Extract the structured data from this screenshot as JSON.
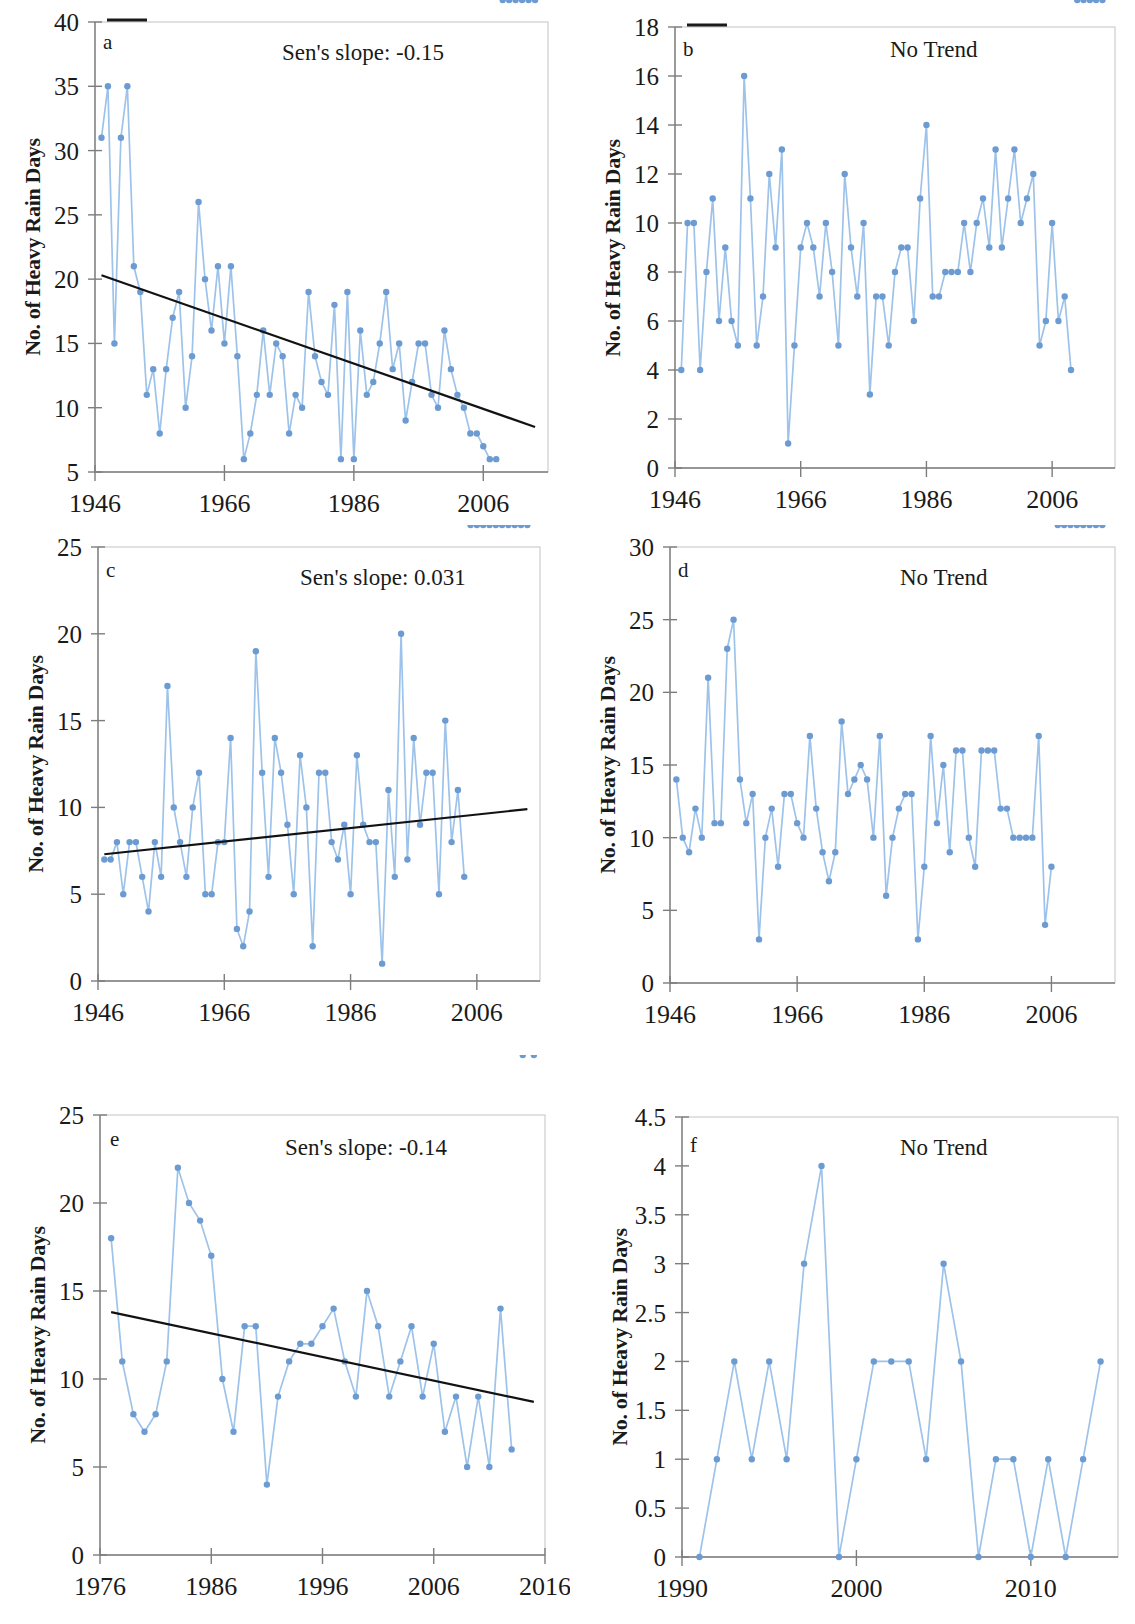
{
  "figure": {
    "axis_label_y": "No. of Heavy Rain Days",
    "marker_color": "#6c9bd2",
    "line_color": "#9dc3ea",
    "trend_color": "#121212"
  },
  "chart_data": [
    {
      "type": "line",
      "panel": "a",
      "title": "",
      "annotation": "Sen's slope: -0.15",
      "xlabel": "",
      "ylabel": "No. of Heavy Rain Days",
      "xlim": [
        1946,
        2016
      ],
      "ylim": [
        5,
        40
      ],
      "yticks": [
        5,
        10,
        15,
        20,
        25,
        30,
        35,
        40
      ],
      "xticks": [
        1946,
        1966,
        1986,
        2006
      ],
      "grid": false,
      "trendline": {
        "x": [
          1947,
          2014
        ],
        "y": [
          20.3,
          8.5
        ]
      },
      "x": [
        1947,
        1948,
        1949,
        1950,
        1951,
        1952,
        1953,
        1954,
        1955,
        1956,
        1957,
        1958,
        1959,
        1960,
        1961,
        1962,
        1963,
        1964,
        1965,
        1966,
        1967,
        1968,
        1969,
        1970,
        1971,
        1972,
        1973,
        1974,
        1975,
        1976,
        1977,
        1978,
        1979,
        1980,
        1981,
        1982,
        1983,
        1984,
        1985,
        1986,
        1987,
        1988,
        1989,
        1990,
        1991,
        1992,
        1993,
        1994,
        1995,
        1996,
        1997,
        1998,
        1999,
        2000,
        2001,
        2002,
        2003,
        2004,
        2005,
        2006,
        2007,
        2008,
        2009,
        2010,
        2011,
        2012,
        2013,
        2014
      ],
      "values": [
        31,
        35,
        15,
        31,
        35,
        21,
        19,
        11,
        13,
        8,
        13,
        17,
        19,
        10,
        14,
        26,
        20,
        16,
        21,
        15,
        21,
        14,
        6,
        8,
        11,
        16,
        11,
        15,
        14,
        8,
        11,
        10,
        19,
        14,
        12,
        11,
        18,
        6,
        19,
        6,
        16,
        11,
        12,
        15,
        19,
        13,
        15,
        9,
        12,
        15,
        15,
        11,
        10,
        16,
        13,
        11,
        10,
        8,
        8,
        7,
        6,
        6
      ]
    },
    {
      "type": "line",
      "panel": "b",
      "title": "",
      "annotation": "No Trend",
      "xlabel": "",
      "ylabel": "No. of Heavy Rain Days",
      "xlim": [
        1946,
        2016
      ],
      "ylim": [
        0,
        18
      ],
      "yticks": [
        0,
        2,
        4,
        6,
        8,
        10,
        12,
        14,
        16,
        18
      ],
      "xticks": [
        1946,
        1966,
        1986,
        2006
      ],
      "grid": false,
      "trendline": null,
      "x": [
        1947,
        1948,
        1949,
        1950,
        1951,
        1952,
        1953,
        1954,
        1955,
        1956,
        1957,
        1958,
        1959,
        1960,
        1961,
        1962,
        1963,
        1964,
        1965,
        1966,
        1967,
        1968,
        1969,
        1970,
        1971,
        1972,
        1973,
        1974,
        1975,
        1976,
        1977,
        1978,
        1979,
        1980,
        1981,
        1982,
        1983,
        1984,
        1985,
        1986,
        1987,
        1988,
        1989,
        1990,
        1991,
        1992,
        1993,
        1994,
        1995,
        1996,
        1997,
        1998,
        1999,
        2000,
        2001,
        2002,
        2003,
        2004,
        2005,
        2006,
        2007,
        2008,
        2009,
        2010,
        2011,
        2012,
        2013,
        2014
      ],
      "values": [
        4,
        10,
        10,
        4,
        8,
        11,
        6,
        9,
        6,
        5,
        16,
        11,
        5,
        7,
        12,
        9,
        13,
        1,
        5,
        9,
        10,
        9,
        7,
        10,
        8,
        5,
        12,
        9,
        7,
        10,
        3,
        7,
        7,
        5,
        8,
        9,
        9,
        6,
        11,
        14,
        7,
        7,
        8,
        8,
        8,
        10,
        8,
        10,
        11,
        9,
        13,
        9,
        11,
        13,
        10,
        11,
        12,
        5,
        6,
        10,
        6,
        7,
        4
      ]
    },
    {
      "type": "line",
      "panel": "c",
      "title": "",
      "annotation": "Sen's slope: 0.031",
      "xlabel": "",
      "ylabel": "No. of Heavy Rain Days",
      "xlim": [
        1946,
        2016
      ],
      "ylim": [
        0,
        25
      ],
      "yticks": [
        0,
        5,
        10,
        15,
        20,
        25
      ],
      "xticks": [
        1946,
        1966,
        1986,
        2006
      ],
      "grid": false,
      "trendline": {
        "x": [
          1947,
          2014
        ],
        "y": [
          7.3,
          9.9
        ]
      },
      "x": [
        1947,
        1948,
        1949,
        1950,
        1951,
        1952,
        1953,
        1954,
        1955,
        1956,
        1957,
        1958,
        1959,
        1960,
        1961,
        1962,
        1963,
        1964,
        1965,
        1966,
        1967,
        1968,
        1969,
        1970,
        1971,
        1972,
        1973,
        1974,
        1975,
        1976,
        1977,
        1978,
        1979,
        1980,
        1981,
        1982,
        1983,
        1984,
        1985,
        1986,
        1987,
        1988,
        1989,
        1990,
        1991,
        1992,
        1993,
        1994,
        1995,
        1996,
        1997,
        1998,
        1999,
        2000,
        2001,
        2002,
        2003,
        2004,
        2005,
        2006,
        2007,
        2008,
        2009,
        2010,
        2011,
        2012,
        2013,
        2014
      ],
      "values": [
        7,
        7,
        8,
        5,
        8,
        8,
        6,
        4,
        8,
        6,
        17,
        10,
        8,
        6,
        10,
        12,
        5,
        5,
        8,
        8,
        14,
        3,
        2,
        4,
        19,
        12,
        6,
        14,
        12,
        9,
        5,
        13,
        10,
        2,
        12,
        12,
        8,
        7,
        9,
        5,
        13,
        9,
        8,
        8,
        1,
        11,
        6,
        20,
        7,
        14,
        9,
        12,
        12,
        5,
        15,
        8,
        11,
        6
      ]
    },
    {
      "type": "line",
      "panel": "d",
      "title": "",
      "annotation": "No Trend",
      "xlabel": "",
      "ylabel": "No. of Heavy Rain Days",
      "xlim": [
        1946,
        2016
      ],
      "ylim": [
        0,
        30
      ],
      "yticks": [
        0,
        5,
        10,
        15,
        20,
        25,
        30
      ],
      "xticks": [
        1946,
        1966,
        1986,
        2006
      ],
      "grid": false,
      "trendline": null,
      "x": [
        1947,
        1948,
        1949,
        1950,
        1951,
        1952,
        1953,
        1954,
        1955,
        1956,
        1957,
        1958,
        1959,
        1960,
        1961,
        1962,
        1963,
        1964,
        1965,
        1966,
        1967,
        1968,
        1969,
        1970,
        1971,
        1972,
        1973,
        1974,
        1975,
        1976,
        1977,
        1978,
        1979,
        1980,
        1981,
        1982,
        1983,
        1984,
        1985,
        1986,
        1987,
        1988,
        1989,
        1990,
        1991,
        1992,
        1993,
        1994,
        1995,
        1996,
        1997,
        1998,
        1999,
        2000,
        2001,
        2002,
        2003,
        2004,
        2005,
        2006,
        2007,
        2008,
        2009,
        2010,
        2011,
        2012,
        2013,
        2014
      ],
      "values": [
        14,
        10,
        9,
        12,
        10,
        21,
        11,
        11,
        23,
        25,
        14,
        11,
        13,
        3,
        10,
        12,
        8,
        13,
        13,
        11,
        10,
        17,
        12,
        9,
        7,
        9,
        18,
        13,
        14,
        15,
        14,
        10,
        17,
        6,
        10,
        12,
        13,
        13,
        3,
        8,
        17,
        11,
        15,
        9,
        16,
        16,
        10,
        8,
        16,
        16,
        16,
        12,
        12,
        10,
        10,
        10,
        10,
        17,
        4,
        8
      ]
    },
    {
      "type": "line",
      "panel": "e",
      "title": "",
      "annotation": "Sen's slope: -0.14",
      "xlabel": "",
      "ylabel": "No. of Heavy Rain Days",
      "xlim": [
        1976,
        2016
      ],
      "ylim": [
        0,
        25
      ],
      "yticks": [
        0,
        5,
        10,
        15,
        20,
        25
      ],
      "xticks": [
        1976,
        1986,
        1996,
        2006,
        2016
      ],
      "grid": false,
      "trendline": {
        "x": [
          1977,
          2015
        ],
        "y": [
          13.8,
          8.7
        ]
      },
      "x": [
        1977,
        1978,
        1979,
        1980,
        1981,
        1982,
        1983,
        1984,
        1985,
        1986,
        1987,
        1988,
        1989,
        1990,
        1991,
        1992,
        1993,
        1994,
        1995,
        1996,
        1997,
        1998,
        1999,
        2000,
        2001,
        2002,
        2003,
        2004,
        2005,
        2006,
        2007,
        2008,
        2009,
        2010,
        2011,
        2012,
        2013,
        2014,
        2015
      ],
      "values": [
        18,
        11,
        8,
        7,
        8,
        11,
        22,
        20,
        19,
        17,
        10,
        7,
        13,
        13,
        4,
        9,
        11,
        12,
        12,
        13,
        14,
        11,
        9,
        15,
        13,
        9,
        11,
        13,
        9,
        12,
        7,
        9,
        5,
        9,
        5,
        14,
        6
      ]
    },
    {
      "type": "line",
      "panel": "f",
      "title": "",
      "annotation": "No Trend",
      "xlabel": "",
      "ylabel": "No. of Heavy Rain Days",
      "xlim": [
        1990,
        2015
      ],
      "ylim": [
        0,
        4.5
      ],
      "yticks": [
        0,
        0.5,
        1,
        1.5,
        2,
        2.5,
        3,
        3.5,
        4,
        4.5
      ],
      "xticks": [
        1990,
        2000,
        2010
      ],
      "grid": false,
      "trendline": null,
      "x": [
        1991,
        1992,
        1993,
        1994,
        1995,
        1996,
        1997,
        1998,
        1999,
        2000,
        2001,
        2002,
        2003,
        2004,
        2005,
        2006,
        2007,
        2008,
        2009,
        2010,
        2011,
        2012,
        2013,
        2014
      ],
      "values": [
        0,
        1,
        2,
        1,
        2,
        1,
        3,
        4,
        0,
        1,
        2,
        2,
        2,
        1,
        3,
        2,
        0,
        1,
        1,
        0,
        1,
        0,
        1,
        2
      ]
    }
  ],
  "panels": {
    "a": {
      "letter": "a",
      "annotation": "Sen's slope: -0.15"
    },
    "b": {
      "letter": "b",
      "annotation": "No Trend"
    },
    "c": {
      "letter": "c",
      "annotation": "Sen's slope: 0.031"
    },
    "d": {
      "letter": "d",
      "annotation": "No Trend"
    },
    "e": {
      "letter": "e",
      "annotation": "Sen's slope: -0.14"
    },
    "f": {
      "letter": "f",
      "annotation": "No Trend"
    }
  }
}
